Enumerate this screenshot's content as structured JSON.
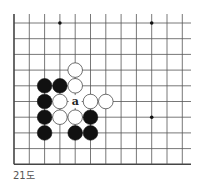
{
  "diagram": {
    "type": "go-board-fragment",
    "caption": "21도",
    "grid": {
      "x_positions": [
        14,
        29.3,
        44.6,
        59.9,
        75.2,
        90.5,
        105.8,
        121.1,
        136.4,
        151.7,
        167,
        182.3
      ],
      "y_positions": [
        23,
        38.7,
        54.4,
        70.1,
        85.8,
        101.5,
        117.2,
        132.9,
        148.6,
        164.3
      ],
      "line_left": 14,
      "line_right": 191,
      "line_top": 14,
      "line_bottom": 164.3,
      "left_edge_is_border": true,
      "bottom_edge_is_border": true,
      "line_color": "#555555",
      "border_color": "#444444"
    },
    "star_points": [
      {
        "col": 3,
        "row": 0
      },
      {
        "col": 9,
        "row": 0
      },
      {
        "col": 9,
        "row": 6
      }
    ],
    "stones": [
      {
        "color": "white",
        "col": 4,
        "row": 3
      },
      {
        "color": "black",
        "col": 2,
        "row": 4
      },
      {
        "color": "black",
        "col": 3,
        "row": 4
      },
      {
        "color": "white",
        "col": 4,
        "row": 4
      },
      {
        "color": "black",
        "col": 2,
        "row": 5
      },
      {
        "color": "white",
        "col": 3,
        "row": 5
      },
      {
        "color": "white",
        "col": 5,
        "row": 5
      },
      {
        "color": "white",
        "col": 6,
        "row": 5
      },
      {
        "color": "black",
        "col": 2,
        "row": 6
      },
      {
        "color": "white",
        "col": 3,
        "row": 6
      },
      {
        "color": "white",
        "col": 4,
        "row": 6
      },
      {
        "color": "black",
        "col": 5,
        "row": 6
      },
      {
        "color": "black",
        "col": 2,
        "row": 7
      },
      {
        "color": "black",
        "col": 4,
        "row": 7
      },
      {
        "color": "black",
        "col": 5,
        "row": 7
      }
    ],
    "labels": [
      {
        "text": "a",
        "col": 4,
        "row": 5
      }
    ],
    "colors": {
      "black_stone": "#111111",
      "white_stone_fill": "#ffffff",
      "white_stone_stroke": "#333333",
      "label": "#222222",
      "background": "#ffffff"
    }
  }
}
